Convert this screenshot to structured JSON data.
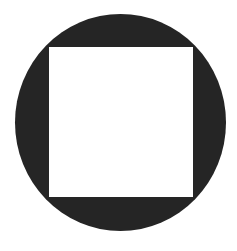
{
  "figure": {
    "shapes": [
      {
        "type": "circle",
        "fill": "#252525"
      },
      {
        "type": "square",
        "fill": "#ffffff"
      }
    ],
    "background": "#ffffff"
  }
}
